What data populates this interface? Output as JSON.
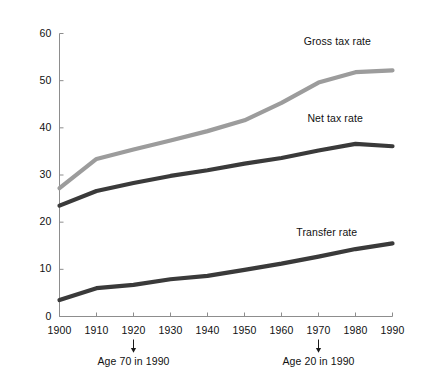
{
  "chart_data": {
    "type": "line",
    "title": "",
    "subtitle": "",
    "xlabel": "",
    "ylabel": "",
    "x": [
      1900,
      1910,
      1920,
      1930,
      1940,
      1950,
      1960,
      1970,
      1980,
      1990
    ],
    "xtick_labels": [
      "1900",
      "1910",
      "1920",
      "1930",
      "1940",
      "1950",
      "1960",
      "1970",
      "1980",
      "1990"
    ],
    "ytick_labels": [
      "0",
      "10",
      "20",
      "30",
      "40",
      "50",
      "60"
    ],
    "yticks": [
      0,
      10,
      20,
      30,
      40,
      50,
      60
    ],
    "xlim": [
      1900,
      1990
    ],
    "ylim": [
      0,
      60
    ],
    "grid": false,
    "legend_position": "inline-right",
    "series": [
      {
        "name": "Gross tax rate",
        "color": "#9c9c9c",
        "values": [
          27.2,
          33.4,
          35.4,
          37.3,
          39.3,
          41.6,
          45.3,
          49.6,
          51.8,
          52.2
        ],
        "label_x": 1966,
        "label_y": 58.3
      },
      {
        "name": "Net tax rate",
        "color": "#3a3a3a",
        "values": [
          23.5,
          26.6,
          28.3,
          29.8,
          31.0,
          32.4,
          33.6,
          35.2,
          36.6,
          36.1
        ],
        "label_x": 1967,
        "label_y": 41.8
      },
      {
        "name": "Transfer rate",
        "color": "#3a3a3a",
        "values": [
          3.5,
          6.0,
          6.7,
          7.9,
          8.6,
          9.9,
          11.2,
          12.7,
          14.3,
          15.5
        ],
        "label_x": 1964,
        "label_y": 17.6
      }
    ],
    "annotations": [
      {
        "text": "Age 70 in 1990",
        "x": 1920
      },
      {
        "text": "Age 20 in 1990",
        "x": 1970
      }
    ]
  }
}
